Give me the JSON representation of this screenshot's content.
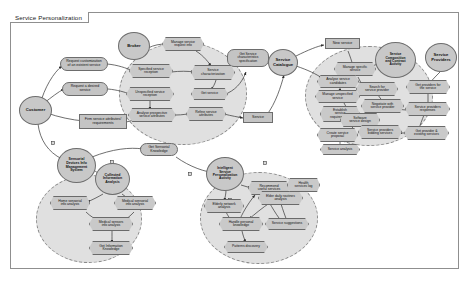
{
  "diagram": {
    "title": "Service Personalization",
    "type": "activity-diagram",
    "colors": {
      "node_fill": "#c8c8c8",
      "node_stroke": "#6d6d6d",
      "cluster_fill": "#e0e0e0",
      "cluster_stroke": "#8a8a8a",
      "frame_stroke": "#8f8f8f",
      "edge_stroke": "#3f3f3f",
      "background": "#ffffff"
    }
  },
  "clusters": [
    {
      "id": "service-reception-cluster",
      "label": ""
    },
    {
      "id": "service-composition-cluster",
      "label": ""
    },
    {
      "id": "collected-information-cluster",
      "label": ""
    },
    {
      "id": "intelligent-personalization-cluster",
      "label": ""
    }
  ],
  "actors": [
    {
      "id": "customer",
      "label": "Customer"
    },
    {
      "id": "broker",
      "label": "Broker"
    },
    {
      "id": "service-catalogue",
      "label": "Service\nCatalogue"
    },
    {
      "id": "service-providers",
      "label": "Service\nProviders"
    },
    {
      "id": "sensorial-devices-info-management-system",
      "label": "Sensorial\nDevices Info\nManagement\nSystem"
    },
    {
      "id": "collected-information-analysis",
      "label": "Collected\nInformation\nAnalysis"
    },
    {
      "id": "intelligent-service-personalization-activity",
      "label": "Intelligent\nService\nPersonalization\nActivity"
    },
    {
      "id": "service-composition-and-contract-activity",
      "label": "Service\nComposition\nand Contract\nActivity"
    }
  ],
  "objects": [
    {
      "id": "request-customization-of-existent-service",
      "label": "Request customization\nof an existent service"
    },
    {
      "id": "request-a-desired-service",
      "label": "Request a desired\nservice"
    },
    {
      "id": "firm-service-attributes-requirements",
      "label": "Firm service attributes/\nrequirements"
    },
    {
      "id": "get-service-characteristics-specification",
      "label": "Get Service\ncharacteristics\nspecification"
    },
    {
      "id": "service",
      "label": "Service"
    },
    {
      "id": "new-service",
      "label": "New service"
    },
    {
      "id": "get-sensorial-knowledge",
      "label": "Get Sensorial\nKnowledge"
    }
  ],
  "actions": [
    {
      "id": "manage-service-request-info",
      "label": "Manage service\nrequest info"
    },
    {
      "id": "specified-service-reception",
      "label": "Specified service\nreception"
    },
    {
      "id": "unspecified-service-reception",
      "label": "Unspecified service\nreception"
    },
    {
      "id": "analyse-prospective-service-attributes",
      "label": "Analyse prospective\nservice attributes"
    },
    {
      "id": "service-characterization",
      "label": "Service\ncharacterization"
    },
    {
      "id": "get-service",
      "label": "Get service"
    },
    {
      "id": "refine-service-attributes",
      "label": "Refine service\nattributes"
    },
    {
      "id": "manage-specific-service",
      "label": "Manage specific\nservice"
    },
    {
      "id": "analyse-service-candidates",
      "label": "Analyse service\ncandidates"
    },
    {
      "id": "manage-unspecified-service",
      "label": "Manage unspecified\nservice"
    },
    {
      "id": "establish-service-requirements",
      "label": "Establish\nservice\nrequirements"
    },
    {
      "id": "search-for-service-provider",
      "label": "Search for\nservice provider"
    },
    {
      "id": "negotiate-with-service-provider",
      "label": "Negotiate with\nservice provider"
    },
    {
      "id": "software-service-design",
      "label": "Software\nservice design"
    },
    {
      "id": "service-providers-bidding-services",
      "label": "Service providers\nbidding services"
    },
    {
      "id": "create-service-proposal",
      "label": "Create service\nproposal"
    },
    {
      "id": "service-analysis",
      "label": "Service analysis"
    },
    {
      "id": "get-providers-for-the-service",
      "label": "Get providers for\nthe service"
    },
    {
      "id": "service-providers-responses",
      "label": "Service providers\nresponses"
    },
    {
      "id": "get-provider-and-existing-services",
      "label": "Get provider &\nexisting services"
    },
    {
      "id": "home-sensorial-info-analysis",
      "label": "Home sensorial\ninfo analysis"
    },
    {
      "id": "medical-sensorial-info-analysis",
      "label": "Medical sensorial\ninfo analysis"
    },
    {
      "id": "medical-sensors-info-analysis",
      "label": "Medical sensors\ninfo analysis"
    },
    {
      "id": "get-information-knowledge",
      "label": "Get Information\nKnowledge"
    },
    {
      "id": "recommend-useful-services",
      "label": "Recommend\nuseful services"
    },
    {
      "id": "elderly-network-analysis",
      "label": "Elderly network\nanalysis"
    },
    {
      "id": "elder-daily-routines-analysis",
      "label": "Elder daily routines\nanalysis"
    },
    {
      "id": "health-services-log",
      "label": "Health\nservices log"
    },
    {
      "id": "handle-personal-knowledge",
      "label": "Handle personal\nknowledge"
    },
    {
      "id": "service-suggestions",
      "label": "Service suggestions"
    },
    {
      "id": "patterns-discovery",
      "label": "Patterns discovery"
    }
  ]
}
